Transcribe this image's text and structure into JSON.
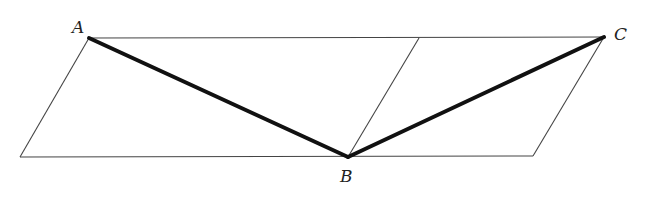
{
  "diagram": {
    "points": {
      "A": {
        "label": "A",
        "x": 89,
        "y": 38
      },
      "B": {
        "label": "B",
        "x": 348,
        "y": 157
      },
      "C": {
        "label": "C",
        "x": 604,
        "y": 37
      }
    },
    "thin_lines": [
      {
        "x1": 89,
        "y1": 38,
        "x2": 604,
        "y2": 37
      },
      {
        "x1": 20,
        "y1": 157,
        "x2": 533,
        "y2": 156
      },
      {
        "x1": 89,
        "y1": 38,
        "x2": 20,
        "y2": 157
      },
      {
        "x1": 419,
        "y1": 38,
        "x2": 348,
        "y2": 157
      },
      {
        "x1": 604,
        "y1": 37,
        "x2": 533,
        "y2": 156
      }
    ],
    "bold_lines": [
      {
        "x1": 89,
        "y1": 38,
        "x2": 348,
        "y2": 157
      },
      {
        "x1": 348,
        "y1": 157,
        "x2": 604,
        "y2": 37
      }
    ],
    "colors": {
      "line": "#333333",
      "bold": "#111111",
      "background": "#ffffff"
    }
  }
}
